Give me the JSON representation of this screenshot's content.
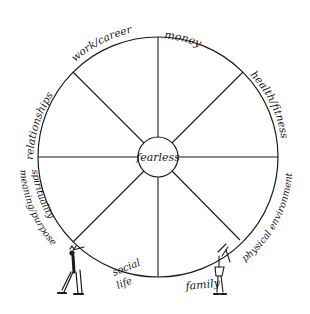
{
  "diagram": {
    "center_label": "fearless",
    "segments": [
      {
        "label": "money"
      },
      {
        "label": "health/fitness"
      },
      {
        "label": "physical environment"
      },
      {
        "label": "family"
      },
      {
        "label": "social life"
      },
      {
        "label": "spirituality meaning/purpose"
      },
      {
        "label": "relationships"
      },
      {
        "label": "work/career"
      }
    ],
    "labels": {
      "money": "money",
      "health_fitness": "health/fitness",
      "physical_environment": "physical environment",
      "family": "family",
      "social": "social",
      "life": "life",
      "spirituality": "spirituality",
      "meaning_purpose": "meaning/purpose",
      "relationships": "relationships",
      "work_career": "work/career"
    },
    "figures": [
      {
        "name": "man pushing wheel",
        "position": "bottom-left"
      },
      {
        "name": "woman pushing wheel",
        "position": "bottom-right"
      }
    ],
    "stroke_color": "#1a1a1a",
    "background_color": "#ffffff"
  }
}
